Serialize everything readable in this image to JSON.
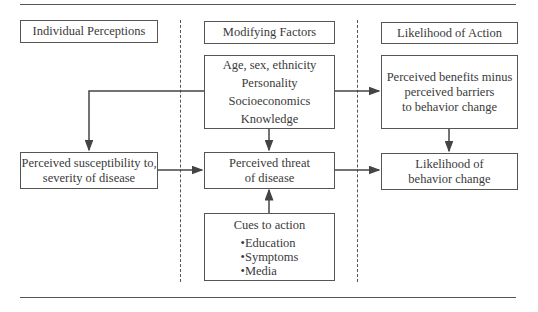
{
  "headers": {
    "individual": "Individual Perceptions",
    "modifying": "Modifying Factors",
    "likelihood": "Likelihood of Action"
  },
  "boxes": {
    "factors": [
      "Age, sex, ethnicity",
      "Personality",
      "Socioeconomics",
      "Knowledge"
    ],
    "benefits": [
      "Perceived benefits minus",
      "perceived barriers",
      "to behavior change"
    ],
    "susceptibility": [
      "Perceived susceptibility to,",
      "severity of disease"
    ],
    "threat": [
      "Perceived threat",
      "of disease"
    ],
    "behavior": [
      "Likelihood of",
      "behavior change"
    ],
    "cues": {
      "title": "Cues to action",
      "items": [
        "Education",
        "Symptoms",
        "Media"
      ]
    }
  },
  "colors": {
    "line": "#555555",
    "text": "#3a3a3a"
  }
}
